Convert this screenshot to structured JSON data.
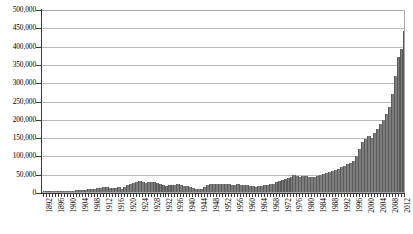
{
  "chart_data": {
    "type": "bar",
    "title": "",
    "subtitle": "",
    "xlabel": "",
    "ylabel": "",
    "ylim": [
      0,
      500000
    ],
    "xlim": [
      1892,
      2013
    ],
    "grid": true,
    "legend": false,
    "legend_position": "none",
    "bar_color": "#7d7d7d",
    "gridline_color": "#b9b9b9",
    "axis_color": "#3a3a3a",
    "y_ticks": [
      {
        "value": 0,
        "label": "0"
      },
      {
        "value": 50000,
        "label": "50,000"
      },
      {
        "value": 100000,
        "label": "100,000"
      },
      {
        "value": 150000,
        "label": "150,000"
      },
      {
        "value": 200000,
        "label": "200,000"
      },
      {
        "value": 250000,
        "label": "250,000"
      },
      {
        "value": 300000,
        "label": "300,000"
      },
      {
        "value": 350000,
        "label": "350,000"
      },
      {
        "value": 400000,
        "label": "400,000"
      },
      {
        "value": 450000,
        "label": "450,000"
      },
      {
        "value": 500000,
        "label": "500,000"
      }
    ],
    "x_tick_labels": [
      "1892",
      "1896",
      "1900",
      "1904",
      "1908",
      "1912",
      "1916",
      "1920",
      "1924",
      "1928",
      "1932",
      "1936",
      "1940",
      "1944",
      "1948",
      "1952",
      "1956",
      "1960",
      "1964",
      "1968",
      "1972",
      "1976",
      "1980",
      "1984",
      "1988",
      "1992",
      "1996",
      "2000",
      "2004",
      "2008",
      "2012"
    ],
    "x_tick_interval": 4,
    "categories": [
      1892,
      1893,
      1894,
      1895,
      1896,
      1897,
      1898,
      1899,
      1900,
      1901,
      1902,
      1903,
      1904,
      1905,
      1906,
      1907,
      1908,
      1909,
      1910,
      1911,
      1912,
      1913,
      1914,
      1915,
      1916,
      1917,
      1918,
      1919,
      1920,
      1921,
      1922,
      1923,
      1924,
      1925,
      1926,
      1927,
      1928,
      1929,
      1930,
      1931,
      1932,
      1933,
      1934,
      1935,
      1936,
      1937,
      1938,
      1939,
      1940,
      1941,
      1942,
      1943,
      1944,
      1945,
      1946,
      1947,
      1948,
      1949,
      1950,
      1951,
      1952,
      1953,
      1954,
      1955,
      1956,
      1957,
      1958,
      1959,
      1960,
      1961,
      1962,
      1963,
      1964,
      1965,
      1966,
      1967,
      1968,
      1969,
      1970,
      1971,
      1972,
      1973,
      1974,
      1975,
      1976,
      1977,
      1978,
      1979,
      1980,
      1981,
      1982,
      1983,
      1984,
      1985,
      1986,
      1987,
      1988,
      1989,
      1990,
      1991,
      1992,
      1993,
      1994,
      1995,
      1996,
      1997,
      1998,
      1999,
      2000,
      2001,
      2002,
      2003,
      2004,
      2005,
      2006,
      2007,
      2008,
      2009,
      2010,
      2011,
      2012,
      2013
    ],
    "values": [
      1200,
      1400,
      1300,
      1600,
      1800,
      2000,
      2200,
      2600,
      3000,
      3400,
      3800,
      4200,
      4800,
      5400,
      6200,
      7000,
      8000,
      9000,
      10000,
      11000,
      13000,
      14000,
      12000,
      11000,
      12000,
      13000,
      9000,
      14000,
      19000,
      22000,
      25000,
      28000,
      31000,
      27000,
      25000,
      26000,
      28000,
      26000,
      24000,
      22000,
      20000,
      16000,
      18000,
      19000,
      20000,
      21000,
      19000,
      17000,
      16000,
      15000,
      11000,
      8000,
      7000,
      9000,
      14000,
      18000,
      21000,
      22000,
      21000,
      22000,
      23000,
      22000,
      21000,
      20000,
      19000,
      21000,
      20000,
      19000,
      18000,
      17000,
      16000,
      15000,
      16000,
      17000,
      18000,
      19000,
      21000,
      23000,
      26000,
      29000,
      33000,
      36000,
      39000,
      42000,
      46000,
      44000,
      41000,
      43000,
      45000,
      42000,
      40000,
      41000,
      43000,
      46000,
      49000,
      52000,
      56000,
      58000,
      61000,
      64000,
      68000,
      72000,
      76000,
      80000,
      86000,
      98000,
      118000,
      138000,
      146000,
      152000,
      148000,
      160000,
      172000,
      186000,
      198000,
      214000,
      232000,
      268000,
      318000,
      368000,
      392000,
      440000
    ]
  }
}
